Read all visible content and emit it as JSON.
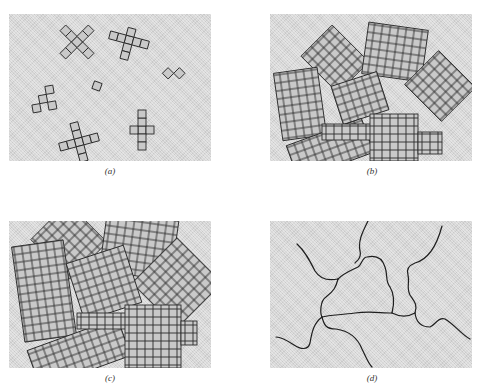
{
  "figure": {
    "panels": [
      {
        "id": "a",
        "label": "(a)",
        "description": "Isolated crystal nuclei/dendrite seeds in liquid"
      },
      {
        "id": "b",
        "label": "(b)",
        "description": "Growing crystallites with random orientations"
      },
      {
        "id": "c",
        "label": "(c)",
        "description": "Crystallites impinging on each other"
      },
      {
        "id": "d",
        "label": "(d)",
        "description": "Final grain boundaries"
      }
    ],
    "colors": {
      "background": "#d6d6d6",
      "cell_fill": "#c9c9c9",
      "outline": "#2a2a2a"
    }
  }
}
